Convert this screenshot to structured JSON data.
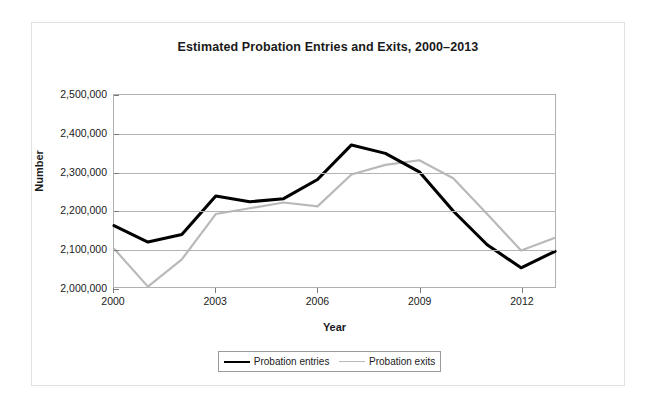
{
  "chart_data": {
    "type": "line",
    "title": "Estimated Probation Entries and Exits, 2000–2013",
    "xlabel": "Year",
    "ylabel": "Number",
    "x": [
      2000,
      2001,
      2002,
      2003,
      2004,
      2005,
      2006,
      2007,
      2008,
      2009,
      2010,
      2011,
      2012,
      2013
    ],
    "xlim": [
      2000,
      2013
    ],
    "ylim": [
      2000000,
      2500000
    ],
    "ytick_labels": [
      "2,500,000",
      "2,400,000",
      "2,300,000",
      "2,200,000",
      "2,100,000",
      "2,000,000"
    ],
    "ytick_values": [
      2500000,
      2400000,
      2300000,
      2200000,
      2100000,
      2000000
    ],
    "xtick_labels": [
      "2000",
      "2003",
      "2006",
      "2009",
      "2012"
    ],
    "xtick_values": [
      2000,
      2003,
      2006,
      2009,
      2012
    ],
    "grid": true,
    "legend_position": "bottom",
    "series": [
      {
        "name": "Probation entries",
        "color": "#000000",
        "values": [
          2160000,
          2117000,
          2137000,
          2237000,
          2222000,
          2230000,
          2280000,
          2370000,
          2348000,
          2300000,
          2198000,
          2110000,
          2050000,
          2093000
        ]
      },
      {
        "name": "Probation exits",
        "color": "#b9b9b9",
        "values": [
          2100000,
          2001000,
          2072000,
          2190000,
          2205000,
          2220000,
          2210000,
          2293000,
          2318000,
          2330000,
          2283000,
          2190000,
          2095000,
          2128000
        ]
      }
    ]
  },
  "legend": {
    "items": [
      {
        "label": "Probation entries"
      },
      {
        "label": "Probation exits"
      }
    ]
  }
}
